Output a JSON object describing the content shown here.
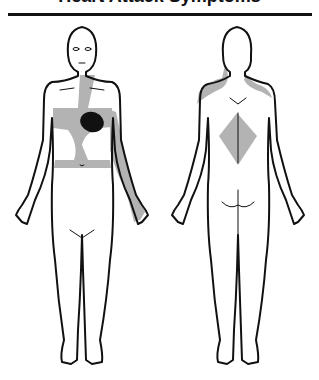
{
  "title": "Heart Attack Symptoms",
  "figures": [
    {
      "view": "front",
      "label": "front-body",
      "regions": [
        "center-chest",
        "left-arm",
        "neck-sternum",
        "upper-abdomen"
      ],
      "focal_point": "heart"
    },
    {
      "view": "back",
      "label": "back-body",
      "regions": [
        "upper-back-shoulders",
        "mid-back"
      ]
    }
  ],
  "colors": {
    "outline": "#111111",
    "referred_pain": "#b3b3b3",
    "heart": "#111111",
    "background": "#ffffff"
  }
}
